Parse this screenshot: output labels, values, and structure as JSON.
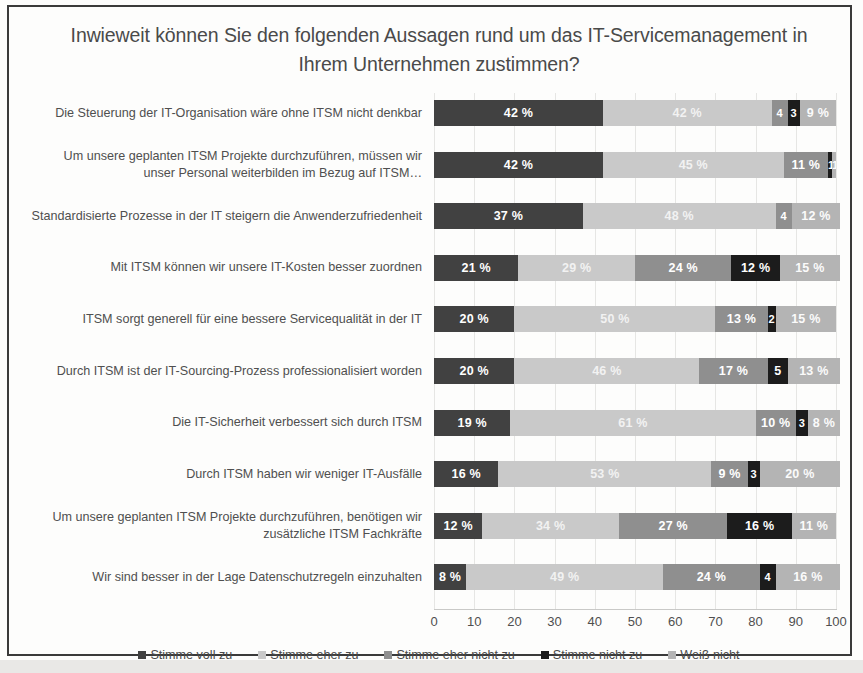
{
  "chart_data": {
    "type": "bar",
    "subtype": "stacked-horizontal-100",
    "title": "Inwieweit können Sie den folgenden Aussagen rund um das IT-Servicemanagement in Ihrem Unternehmen zustimmen?",
    "xlabel": "",
    "ylabel": "",
    "xlim": [
      0,
      100
    ],
    "grid": true,
    "legend_position": "bottom",
    "x_ticks": [
      "0",
      "10",
      "20",
      "30",
      "40",
      "50",
      "60",
      "70",
      "80",
      "90",
      "100"
    ],
    "categories": [
      "Die Steuerung der IT-Organisation wäre ohne ITSM nicht denkbar",
      "Um unsere geplanten ITSM Projekte durchzuführen, müssen wir unser Personal weiterbilden im Bezug auf ITSM…",
      "Standardisierte Prozesse in der IT steigern die Anwenderzufriedenheit",
      "Mit ITSM können wir unsere IT-Kosten besser zuordnen",
      "ITSM sorgt generell für eine bessere Servicequalität in der IT",
      "Durch ITSM ist der IT-Sourcing-Prozess professionalisiert worden",
      "Die IT-Sicherheit verbessert sich durch ITSM",
      "Durch ITSM haben wir weniger IT-Ausfälle",
      "Um unsere geplanten ITSM Projekte durchzuführen, benötigen wir zusätzliche ITSM Fachkräfte",
      "Wir sind besser in der Lage Datenschutzregeln einzuhalten"
    ],
    "series": [
      {
        "name": "Stimme voll zu",
        "color": "#414141",
        "values": [
          42,
          42,
          37,
          21,
          20,
          20,
          19,
          16,
          12,
          8
        ],
        "labels": [
          "42 %",
          "42 %",
          "37 %",
          "21 %",
          "20 %",
          "20 %",
          "19 %",
          "16 %",
          "12 %",
          "8 %"
        ]
      },
      {
        "name": "Stimme eher zu",
        "color": "#c9c9c9",
        "values": [
          42,
          45,
          48,
          29,
          50,
          46,
          61,
          53,
          34,
          49
        ],
        "labels": [
          "42 %",
          "45 %",
          "48 %",
          "29 %",
          "50 %",
          "46 %",
          "61 %",
          "53 %",
          "34 %",
          "49 %"
        ]
      },
      {
        "name": "Stimme eher nicht zu",
        "color": "#8f8f8f",
        "values": [
          4,
          11,
          4,
          24,
          13,
          17,
          10,
          9,
          27,
          24
        ],
        "labels": [
          "4",
          "11 %",
          "4",
          "24 %",
          "13 %",
          "17 %",
          "10 %",
          "9 %",
          "27 %",
          "24 %"
        ]
      },
      {
        "name": "Stimme nicht zu",
        "color": "#1c1c1c",
        "values": [
          3,
          1,
          0,
          12,
          2,
          5,
          3,
          3,
          16,
          4
        ],
        "labels": [
          "3",
          "1",
          "",
          "12 %",
          "2",
          "5",
          "3",
          "3",
          "16 %",
          "4"
        ]
      },
      {
        "name": "Weiß nicht",
        "color": "#b4b4b4",
        "values": [
          9,
          1,
          12,
          15,
          15,
          13,
          8,
          20,
          11,
          16
        ],
        "labels": [
          "9 %",
          "1",
          "12 %",
          "15 %",
          "15 %",
          "13 %",
          "8 %",
          "20 %",
          "11 %",
          "16 %"
        ]
      }
    ]
  }
}
